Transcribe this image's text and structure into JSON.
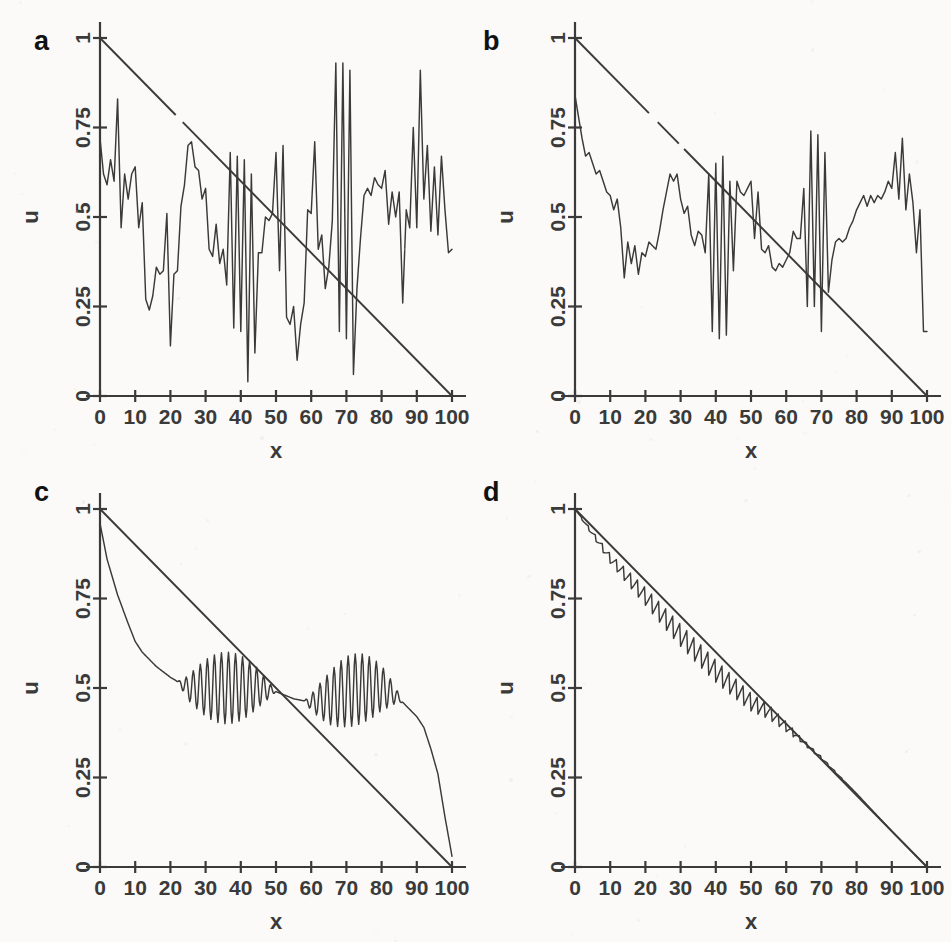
{
  "figure": {
    "background_color": "#fbfaf8",
    "ink_color": "#3a3a3a",
    "panel_count": 4,
    "layout": "2x2"
  },
  "panels": [
    {
      "letter": "a",
      "xlabel": "x",
      "ylabel": "u"
    },
    {
      "letter": "b",
      "xlabel": "x",
      "ylabel": "u"
    },
    {
      "letter": "c",
      "xlabel": "x",
      "ylabel": "u"
    },
    {
      "letter": "d",
      "xlabel": "x",
      "ylabel": "u"
    }
  ],
  "axes": {
    "x_ticks": [
      "0",
      "10",
      "20",
      "30",
      "40",
      "50",
      "60",
      "70",
      "80",
      "90",
      "100"
    ],
    "y_ticks": [
      "0",
      "0.25",
      "0.5",
      "0.75",
      "1"
    ],
    "xlabel": "x",
    "ylabel": "u",
    "xlim": [
      0,
      100
    ],
    "ylim": [
      0,
      1
    ]
  },
  "chart_data": [
    {
      "type": "line",
      "panel": "a",
      "title": "a",
      "xlabel": "x",
      "ylabel": "u",
      "xlim": [
        0,
        100
      ],
      "ylim": [
        0,
        1
      ],
      "grid": false,
      "legend": "none",
      "x_ticks": [
        0,
        10,
        20,
        30,
        40,
        50,
        60,
        70,
        80,
        90,
        100
      ],
      "y_ticks": [
        0,
        0.25,
        0.5,
        0.75,
        1
      ],
      "series": [
        {
          "name": "reference",
          "style": "straight-line",
          "x": [
            0,
            100
          ],
          "values": [
            1,
            0
          ]
        },
        {
          "name": "numerical",
          "style": "oscillatory",
          "x": [
            0,
            1,
            2,
            3,
            4,
            5,
            6,
            7,
            8,
            9,
            10,
            11,
            12,
            13,
            14,
            15,
            16,
            17,
            18,
            19,
            20,
            21,
            22,
            23,
            24,
            25,
            26,
            27,
            28,
            29,
            30,
            31,
            32,
            33,
            34,
            35,
            36,
            37,
            38,
            39,
            40,
            41,
            42,
            43,
            44,
            45,
            46,
            47,
            48,
            49,
            50,
            51,
            52,
            53,
            54,
            55,
            56,
            57,
            58,
            59,
            60,
            61,
            62,
            63,
            64,
            65,
            66,
            67,
            68,
            69,
            70,
            71,
            72,
            73,
            74,
            75,
            76,
            77,
            78,
            79,
            80,
            81,
            82,
            83,
            84,
            85,
            86,
            87,
            88,
            89,
            90,
            91,
            92,
            93,
            94,
            95,
            96,
            97,
            98,
            99,
            100
          ],
          "values": [
            0.72,
            0.62,
            0.59,
            0.66,
            0.6,
            0.83,
            0.47,
            0.62,
            0.55,
            0.62,
            0.64,
            0.47,
            0.54,
            0.27,
            0.24,
            0.28,
            0.36,
            0.34,
            0.35,
            0.51,
            0.14,
            0.34,
            0.35,
            0.53,
            0.59,
            0.7,
            0.71,
            0.64,
            0.63,
            0.55,
            0.58,
            0.41,
            0.39,
            0.48,
            0.37,
            0.41,
            0.31,
            0.68,
            0.19,
            0.67,
            0.18,
            0.66,
            0.04,
            0.62,
            0.12,
            0.4,
            0.4,
            0.5,
            0.49,
            0.51,
            0.68,
            0.35,
            0.7,
            0.22,
            0.2,
            0.25,
            0.1,
            0.2,
            0.26,
            0.52,
            0.51,
            0.71,
            0.41,
            0.45,
            0.3,
            0.36,
            0.49,
            0.93,
            0.18,
            0.93,
            0.16,
            0.91,
            0.06,
            0.3,
            0.44,
            0.56,
            0.58,
            0.56,
            0.61,
            0.59,
            0.58,
            0.63,
            0.48,
            0.57,
            0.5,
            0.57,
            0.26,
            0.52,
            0.47,
            0.75,
            0.47,
            0.91,
            0.55,
            0.7,
            0.46,
            0.64,
            0.45,
            0.67,
            0.52,
            0.4,
            0.41
          ]
        }
      ]
    },
    {
      "type": "line",
      "panel": "b",
      "title": "b",
      "xlabel": "x",
      "ylabel": "u",
      "xlim": [
        0,
        100
      ],
      "ylim": [
        0,
        1
      ],
      "grid": false,
      "legend": "none",
      "x_ticks": [
        0,
        10,
        20,
        30,
        40,
        50,
        60,
        70,
        80,
        90,
        100
      ],
      "y_ticks": [
        0,
        0.25,
        0.5,
        0.75,
        1
      ],
      "series": [
        {
          "name": "reference",
          "style": "straight-line",
          "x": [
            0,
            100
          ],
          "values": [
            1,
            0
          ]
        },
        {
          "name": "numerical",
          "style": "oscillatory",
          "x": [
            0,
            1,
            2,
            3,
            4,
            5,
            6,
            7,
            8,
            9,
            10,
            11,
            12,
            13,
            14,
            15,
            16,
            17,
            18,
            19,
            20,
            21,
            22,
            23,
            24,
            25,
            26,
            27,
            28,
            29,
            30,
            31,
            32,
            33,
            34,
            35,
            36,
            37,
            38,
            39,
            40,
            41,
            42,
            43,
            44,
            45,
            46,
            47,
            48,
            49,
            50,
            51,
            52,
            53,
            54,
            55,
            56,
            57,
            58,
            59,
            60,
            61,
            62,
            63,
            64,
            65,
            66,
            67,
            68,
            69,
            70,
            71,
            72,
            73,
            74,
            75,
            76,
            77,
            78,
            79,
            80,
            81,
            82,
            83,
            84,
            85,
            86,
            87,
            88,
            89,
            90,
            91,
            92,
            93,
            94,
            95,
            96,
            97,
            98,
            99,
            100
          ],
          "values": [
            0.84,
            0.78,
            0.72,
            0.67,
            0.68,
            0.65,
            0.62,
            0.63,
            0.6,
            0.57,
            0.56,
            0.52,
            0.55,
            0.47,
            0.33,
            0.43,
            0.37,
            0.42,
            0.34,
            0.4,
            0.39,
            0.43,
            0.42,
            0.41,
            0.46,
            0.52,
            0.57,
            0.62,
            0.6,
            0.62,
            0.55,
            0.51,
            0.53,
            0.45,
            0.42,
            0.46,
            0.45,
            0.4,
            0.62,
            0.18,
            0.65,
            0.16,
            0.67,
            0.17,
            0.6,
            0.35,
            0.6,
            0.57,
            0.56,
            0.58,
            0.6,
            0.44,
            0.57,
            0.41,
            0.4,
            0.42,
            0.36,
            0.35,
            0.37,
            0.36,
            0.38,
            0.4,
            0.46,
            0.44,
            0.44,
            0.58,
            0.25,
            0.74,
            0.25,
            0.73,
            0.18,
            0.68,
            0.29,
            0.38,
            0.43,
            0.44,
            0.43,
            0.44,
            0.47,
            0.49,
            0.52,
            0.54,
            0.56,
            0.53,
            0.56,
            0.54,
            0.56,
            0.55,
            0.57,
            0.6,
            0.58,
            0.68,
            0.55,
            0.72,
            0.52,
            0.62,
            0.54,
            0.4,
            0.52,
            0.18,
            0.18
          ]
        }
      ]
    },
    {
      "type": "line",
      "panel": "c",
      "title": "c",
      "xlabel": "x",
      "ylabel": "u",
      "xlim": [
        0,
        100
      ],
      "ylim": [
        0,
        1
      ],
      "grid": false,
      "legend": "none",
      "x_ticks": [
        0,
        10,
        20,
        30,
        40,
        50,
        60,
        70,
        80,
        90,
        100
      ],
      "y_ticks": [
        0,
        0.25,
        0.5,
        0.75,
        1
      ],
      "description": "smooth decay with two wavepacket oscillation envelopes, then staircase drop to near zero",
      "series": [
        {
          "name": "reference",
          "style": "straight-line",
          "x": [
            0,
            100
          ],
          "values": [
            1,
            0
          ]
        },
        {
          "name": "numerical",
          "style": "wavepacket",
          "envelope_regions": [
            [
              22,
              50
            ],
            [
              58,
              86
            ]
          ],
          "envelope_peak_amplitude": 0.1,
          "oscillation_period": 2,
          "baseline_x": [
            0,
            2,
            5,
            8,
            10,
            12,
            14,
            16,
            20,
            25,
            30,
            35,
            40,
            45,
            50,
            55,
            60,
            65,
            70,
            75,
            80,
            84,
            86,
            88,
            90,
            92,
            94,
            96,
            98,
            100
          ],
          "baseline_values": [
            0.96,
            0.86,
            0.76,
            0.68,
            0.63,
            0.6,
            0.58,
            0.56,
            0.53,
            0.5,
            0.5,
            0.5,
            0.5,
            0.5,
            0.49,
            0.47,
            0.46,
            0.47,
            0.49,
            0.5,
            0.5,
            0.48,
            0.46,
            0.44,
            0.42,
            0.39,
            0.33,
            0.26,
            0.14,
            0.03
          ]
        }
      ]
    },
    {
      "type": "line",
      "panel": "d",
      "title": "d",
      "xlabel": "x",
      "ylabel": "u",
      "xlim": [
        0,
        100
      ],
      "ylim": [
        0,
        1
      ],
      "grid": false,
      "legend": "none",
      "x_ticks": [
        0,
        10,
        20,
        30,
        40,
        50,
        60,
        70,
        80,
        90,
        100
      ],
      "y_ticks": [
        0,
        0.25,
        0.5,
        0.75,
        1
      ],
      "description": "numerical solution tracks the reference line closely with small sawtooth ripple",
      "series": [
        {
          "name": "reference",
          "style": "straight-line",
          "x": [
            0,
            100
          ],
          "values": [
            1,
            0
          ]
        },
        {
          "name": "numerical",
          "style": "sawtooth-near-line",
          "max_deviation": 0.04,
          "x": [
            0,
            10,
            20,
            30,
            40,
            50,
            55,
            60,
            70,
            80,
            90,
            100
          ],
          "values": [
            1.0,
            0.87,
            0.77,
            0.665,
            0.565,
            0.475,
            0.445,
            0.4,
            0.305,
            0.205,
            0.1,
            0.0
          ]
        }
      ]
    }
  ]
}
